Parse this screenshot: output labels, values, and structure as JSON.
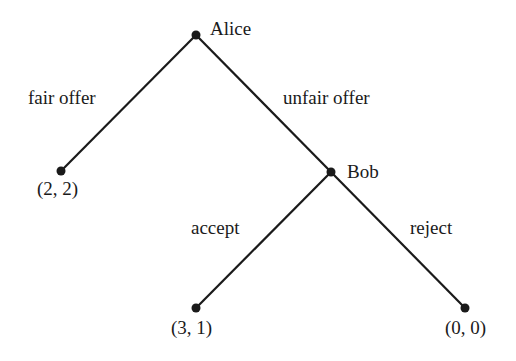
{
  "diagram": {
    "type": "game-tree",
    "nodes": [
      {
        "id": "alice",
        "label": "Alice",
        "x": 196,
        "y": 35,
        "kind": "decision"
      },
      {
        "id": "bob",
        "label": "Bob",
        "x": 331,
        "y": 172,
        "kind": "decision"
      },
      {
        "id": "leaf_fair",
        "label": "(2, 2)",
        "x": 61,
        "y": 171,
        "kind": "terminal"
      },
      {
        "id": "leaf_accept",
        "label": "(3, 1)",
        "x": 196,
        "y": 308,
        "kind": "terminal"
      },
      {
        "id": "leaf_reject",
        "label": "(0, 0)",
        "x": 465,
        "y": 308,
        "kind": "terminal"
      }
    ],
    "edges": [
      {
        "from": "alice",
        "to": "leaf_fair",
        "label": "fair offer"
      },
      {
        "from": "alice",
        "to": "bob",
        "label": "unfair offer"
      },
      {
        "from": "bob",
        "to": "leaf_accept",
        "label": "accept"
      },
      {
        "from": "bob",
        "to": "leaf_reject",
        "label": "reject"
      }
    ],
    "colors": {
      "line": "#1a1a1a",
      "text": "#1a1a1a",
      "background": "#ffffff"
    }
  }
}
